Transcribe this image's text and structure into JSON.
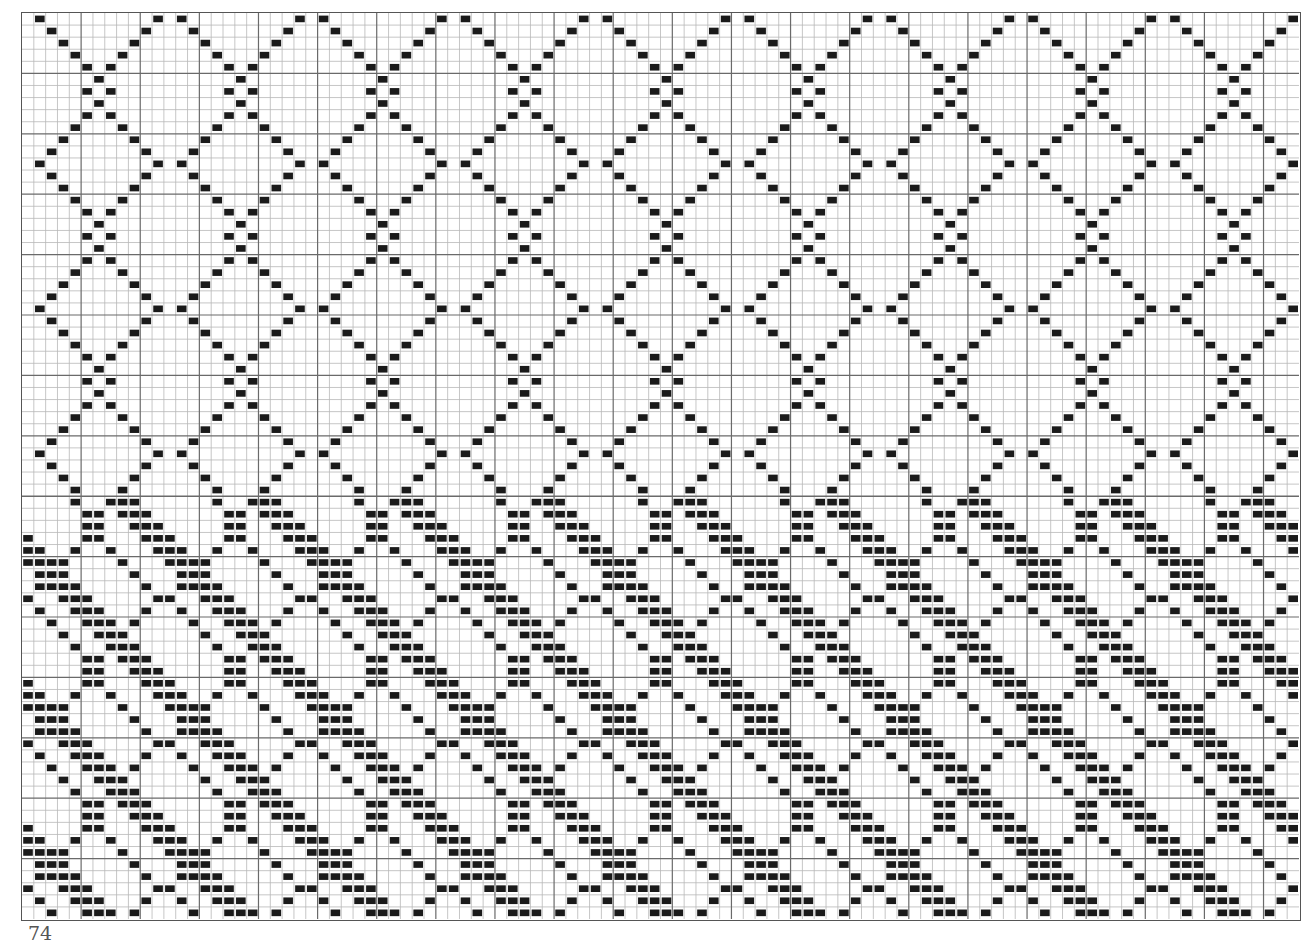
{
  "document": {
    "type": "weaving-draft",
    "page_number": "74"
  },
  "grid": {
    "columns": 108,
    "rows": 75,
    "major_every": 5,
    "section_split_row": 40,
    "colors": {
      "background": "#ffffff",
      "minor_line": "#b8b8b8",
      "major_line": "#6a6a6a",
      "fill": "#1a1a1a"
    }
  },
  "sections": [
    {
      "name": "upper-point-twill-diamond",
      "rows": [
        0,
        39
      ],
      "motif": "single-cell marks forming zig-zag diamond lattice",
      "period_columns": 12,
      "period_rows": 12,
      "bar_length": 1
    },
    {
      "name": "lower-diagonal-bar-diamond",
      "rows": [
        40,
        74
      ],
      "motif": "three-cell horizontal bars stepping diagonally, interleaved with single-cell diamond marks",
      "period_columns": 12,
      "period_rows": 12,
      "bar_length": 3
    }
  ]
}
